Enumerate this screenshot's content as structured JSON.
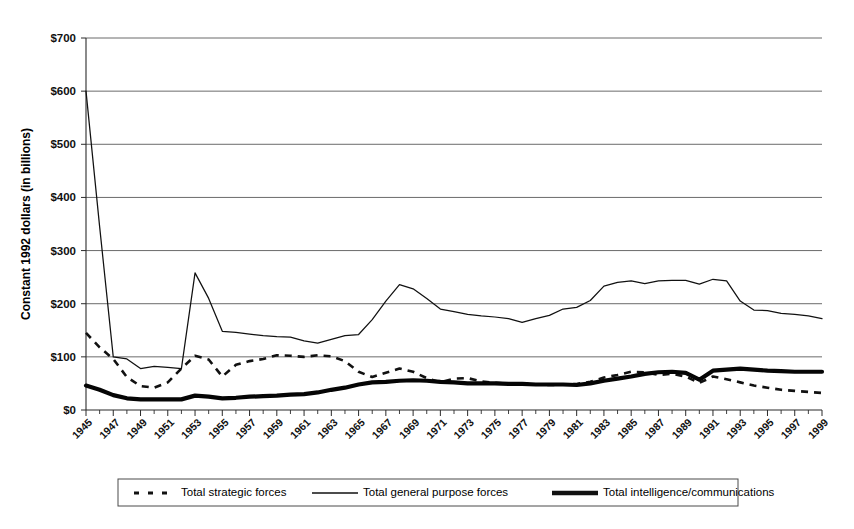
{
  "chart_data": {
    "type": "line",
    "title": "",
    "xlabel": "",
    "ylabel": "Constant 1992 dollars (in billions)",
    "ylim": [
      0,
      700
    ],
    "xlim": [
      1945,
      1999
    ],
    "y_tick_labels": [
      "$0",
      "$100",
      "$200",
      "$300",
      "$400",
      "$500",
      "$600",
      "$700"
    ],
    "y_tick_values": [
      0,
      100,
      200,
      300,
      400,
      500,
      600,
      700
    ],
    "grid": "horizontal",
    "legend_position": "bottom",
    "x": [
      1945,
      1946,
      1947,
      1948,
      1949,
      1950,
      1951,
      1952,
      1953,
      1954,
      1955,
      1956,
      1957,
      1958,
      1959,
      1960,
      1961,
      1962,
      1963,
      1964,
      1965,
      1966,
      1967,
      1968,
      1969,
      1970,
      1971,
      1972,
      1973,
      1974,
      1975,
      1976,
      1977,
      1978,
      1979,
      1980,
      1981,
      1982,
      1983,
      1984,
      1985,
      1986,
      1987,
      1988,
      1989,
      1990,
      1991,
      1992,
      1993,
      1994,
      1995,
      1996,
      1997,
      1998,
      1999
    ],
    "x_tick_labels": [
      "1945",
      "1947",
      "1949",
      "1951",
      "1953",
      "1955",
      "1957",
      "1959",
      "1961",
      "1963",
      "1965",
      "1967",
      "1969",
      "1971",
      "1973",
      "1975",
      "1977",
      "1979",
      "1981",
      "1983",
      "1985",
      "1987",
      "1989",
      "1991",
      "1993",
      "1995",
      "1997",
      "1999"
    ],
    "series": [
      {
        "name": "Total strategic forces",
        "style": "dashed",
        "values": [
          145,
          118,
          96,
          62,
          45,
          42,
          52,
          78,
          102,
          95,
          63,
          85,
          92,
          96,
          103,
          102,
          100,
          103,
          101,
          92,
          72,
          62,
          70,
          78,
          72,
          60,
          52,
          59,
          60,
          54,
          51,
          50,
          50,
          48,
          47,
          48,
          49,
          53,
          61,
          66,
          72,
          71,
          66,
          68,
          63,
          51,
          63,
          58,
          52,
          46,
          42,
          38,
          36,
          34,
          32
        ]
      },
      {
        "name": "Total general purpose forces",
        "style": "solid-thin",
        "values": [
          600,
          345,
          100,
          96,
          78,
          82,
          80,
          78,
          258,
          210,
          148,
          146,
          143,
          140,
          138,
          137,
          130,
          126,
          133,
          140,
          142,
          170,
          205,
          236,
          228,
          210,
          190,
          185,
          180,
          177,
          175,
          172,
          165,
          172,
          178,
          190,
          193,
          206,
          233,
          240,
          243,
          238,
          243,
          244,
          244,
          237,
          246,
          243,
          205,
          188,
          187,
          182,
          180,
          177,
          172
        ]
      },
      {
        "name": "Total intelligence/communications",
        "style": "solid-thick",
        "values": [
          46,
          38,
          28,
          22,
          20,
          20,
          20,
          20,
          27,
          25,
          22,
          23,
          25,
          26,
          27,
          29,
          30,
          33,
          38,
          42,
          48,
          52,
          53,
          55,
          56,
          55,
          53,
          52,
          50,
          50,
          50,
          49,
          49,
          48,
          48,
          48,
          47,
          50,
          55,
          59,
          63,
          68,
          71,
          72,
          70,
          57,
          74,
          76,
          78,
          76,
          74,
          73,
          72,
          72,
          72
        ]
      }
    ]
  },
  "legend": {
    "items": [
      {
        "label": "Total strategic forces",
        "marker": "dashed-line-marker"
      },
      {
        "label": "Total general purpose forces",
        "marker": "thin-line-marker"
      },
      {
        "label": "Total intelligence/communications",
        "marker": "thick-line-marker"
      }
    ]
  }
}
